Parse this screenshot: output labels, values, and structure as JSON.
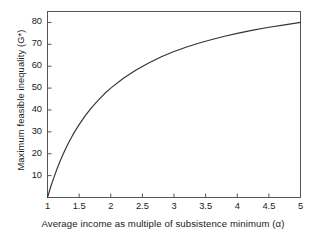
{
  "chart_data": {
    "type": "line",
    "title": "",
    "xlabel": "Average income as multiple of subsistence minimum (α)",
    "ylabel": "Maximum feasible inequality (G*)",
    "xlim": [
      1,
      5
    ],
    "ylim": [
      0,
      85
    ],
    "grid": false,
    "legend": null,
    "xticks": [
      "1",
      "1.5",
      "2",
      "2.5",
      "3",
      "3.5",
      "4",
      "4.5",
      "5"
    ],
    "xtick_values": [
      1,
      1.5,
      2,
      2.5,
      3,
      3.5,
      4,
      4.5,
      5
    ],
    "yticks": [
      "10",
      "20",
      "30",
      "40",
      "50",
      "60",
      "70",
      "80"
    ],
    "ytick_values": [
      10,
      20,
      30,
      40,
      50,
      60,
      70,
      80
    ],
    "series": [
      {
        "name": "Maximum feasible inequality",
        "color": "#333333",
        "x": [
          1.0,
          1.05,
          1.1,
          1.15,
          1.2,
          1.25,
          1.3,
          1.35,
          1.4,
          1.45,
          1.5,
          1.6,
          1.7,
          1.8,
          1.9,
          2.0,
          2.2,
          2.4,
          2.6,
          2.8,
          3.0,
          3.2,
          3.4,
          3.6,
          3.8,
          4.0,
          4.25,
          4.5,
          4.75,
          5.0
        ],
        "y": [
          0.0,
          4.8,
          9.1,
          13.0,
          16.7,
          20.0,
          23.1,
          25.9,
          28.6,
          31.0,
          33.3,
          37.5,
          41.2,
          44.4,
          47.4,
          50.0,
          54.5,
          58.3,
          61.5,
          64.3,
          66.7,
          68.8,
          70.6,
          72.2,
          73.7,
          75.0,
          76.5,
          77.8,
          78.9,
          80.0
        ]
      }
    ],
    "axis_color": "#555555",
    "curve_endpoint_value": 80
  },
  "axes": {
    "y_axis_title": "Maximum feasible inequality (G*)",
    "x_axis_title": "Average income as multiple of subsistence minimum (α)"
  }
}
